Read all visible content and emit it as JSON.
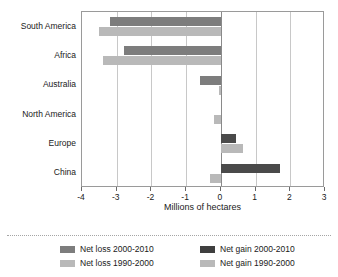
{
  "chart_data": {
    "type": "bar",
    "orientation": "horizontal",
    "title": "",
    "xlabel": "Millions of hectares",
    "ylabel": "",
    "xlim": [
      -4,
      3
    ],
    "xticks": [
      -4,
      -3,
      -2,
      -1,
      0,
      1,
      2,
      3
    ],
    "xtick_labels": [
      "-4",
      "-3",
      "-2",
      "-1",
      "0",
      "1",
      "2",
      "3"
    ],
    "grid": true,
    "legend_position": "bottom",
    "categories": [
      "South America",
      "Africa",
      "Australia",
      "North America",
      "Europe",
      "China"
    ],
    "series": [
      {
        "name": "2000-2010",
        "legend_loss": "Net loss 2000-2010",
        "legend_gain": "Net gain 2000-2010",
        "loss_color": "#7d7d7d",
        "gain_color": "#4a4a4a",
        "values": [
          -3.2,
          -2.8,
          -0.6,
          0.0,
          0.45,
          1.7
        ]
      },
      {
        "name": "1990-2000",
        "legend_loss": "Net loss 1990-2000",
        "legend_gain": "Net gain 1990-2000",
        "loss_color": "#b9b9b9",
        "gain_color": "#b9b9b9",
        "values": [
          -3.5,
          -3.4,
          -0.05,
          -0.2,
          0.65,
          -0.3
        ]
      }
    ]
  },
  "legend": {
    "items": [
      {
        "label": "Net loss 2000-2010",
        "color": "#7d7d7d"
      },
      {
        "label": "Net loss 1990-2000",
        "color": "#b9b9b9"
      },
      {
        "label": "Net gain 2000-2010",
        "color": "#3f3f3f"
      },
      {
        "label": "Net gain 1990-2000",
        "color": "#b9b9b9"
      }
    ]
  }
}
